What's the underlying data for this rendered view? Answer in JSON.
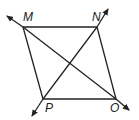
{
  "diagram": {
    "type": "quadrilateral with diagonals",
    "vertices": {
      "M": {
        "label": "M",
        "x": 23,
        "y": 27
      },
      "N": {
        "label": "N",
        "x": 97,
        "y": 27
      },
      "P": {
        "label": "P",
        "x": 43,
        "y": 99
      },
      "O": {
        "label": "O",
        "x": 116,
        "y": 99
      }
    },
    "sides": [
      "MN",
      "NO",
      "OP",
      "PM"
    ],
    "diagonals": [
      "MO (extended as a line with arrows)",
      "NP (extended as a line with arrows)"
    ],
    "colors": {
      "stroke": "#222222",
      "background": "#ffffff"
    }
  },
  "labels": {
    "m": "M",
    "n": "N",
    "p": "P",
    "o": "O"
  }
}
